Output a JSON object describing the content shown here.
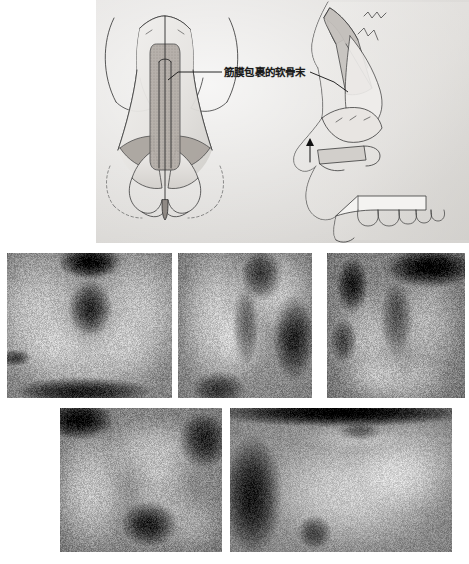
{
  "figure": {
    "type": "surgical-technique-figure",
    "illustration": {
      "title": "",
      "label_text": "筋膜包裹的软骨末",
      "label_name": "fascia-wrapped-cartilage-end-label",
      "views": [
        {
          "name": "frontal-view-nose",
          "description": "Frontal view of nose showing dorsal onlay graft in midline"
        },
        {
          "name": "lateral-view-nose",
          "description": "Lateral profile view of nose with dorsal graft, septal extension and columellar strut"
        }
      ],
      "background_color": "#dcdad7",
      "line_color": "#2b2b2b",
      "graft_fill_color": "#b9b4b0"
    },
    "photos": [
      {
        "name": "photo-intraoperative-basal-view",
        "row": 1,
        "position": 1,
        "caption": ""
      },
      {
        "name": "photo-intraoperative-oblique-view",
        "row": 1,
        "position": 2,
        "caption": ""
      },
      {
        "name": "photo-intraoperative-graft-placement",
        "row": 1,
        "position": 3,
        "caption": ""
      },
      {
        "name": "photo-intraoperative-graft-insertion",
        "row": 2,
        "position": 1,
        "caption": ""
      },
      {
        "name": "photo-postoperative-dorsum-profile",
        "row": 2,
        "position": 2,
        "caption": ""
      }
    ]
  }
}
